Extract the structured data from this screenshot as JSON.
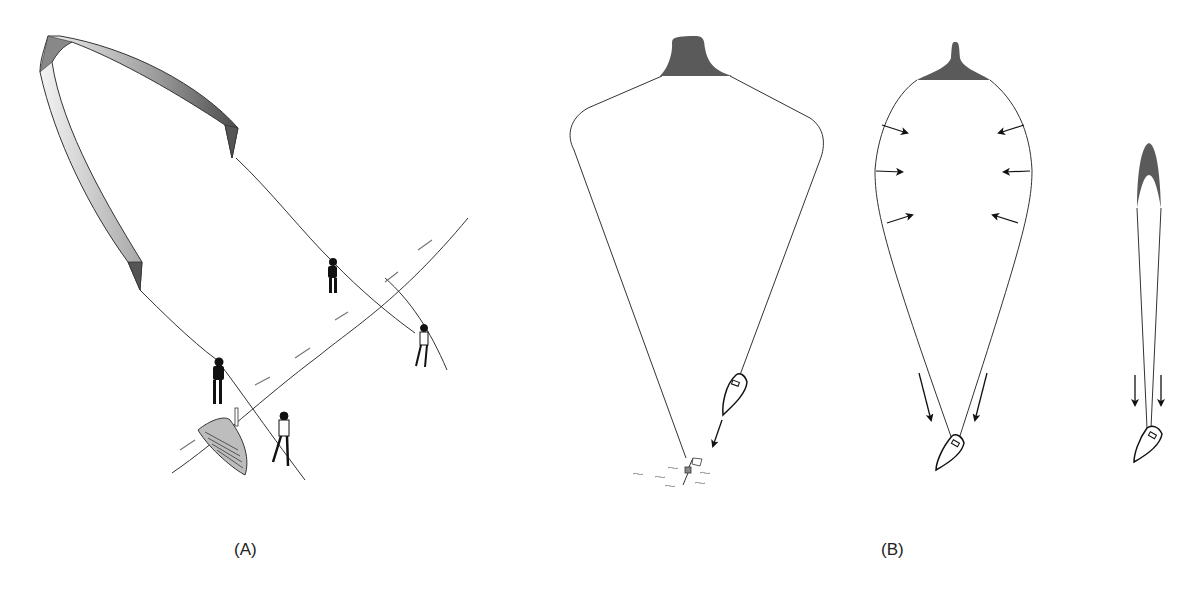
{
  "figure": {
    "panels": [
      {
        "id": "A",
        "label": "(A)",
        "description": "Large arched kite/parachute lines held by four people on ground near a river, with a rowing boat"
      },
      {
        "id": "B",
        "label": "(B)",
        "stages": [
          {
            "name": "stage-1",
            "description": "Inflated canopy with boat drifting toward marker buoy with flag"
          },
          {
            "name": "stage-2",
            "description": "Canopy collapsing with inward arrows; boat pulled by two downward arrows"
          },
          {
            "name": "stage-3",
            "description": "Fully collapsed narrow canopy with two downward arrows above boat"
          }
        ]
      }
    ]
  },
  "colors": {
    "line": "#333333",
    "canopy_dark": "#5a5a5a",
    "figure_dark": "#111111",
    "background": "#ffffff"
  }
}
